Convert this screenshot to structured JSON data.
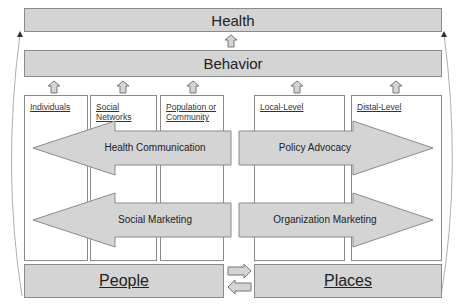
{
  "top": {
    "health": "Health",
    "behavior": "Behavior"
  },
  "columns": [
    {
      "label": "Individuals"
    },
    {
      "label": "Social Networks"
    },
    {
      "label": "Population or Community"
    },
    {
      "label": "Local-Level"
    },
    {
      "label": "Distal-Level"
    }
  ],
  "arrows": {
    "health_communication": "Health Communication",
    "policy_advocacy": "Policy Advocacy",
    "social_marketing": "Social Marketing",
    "organization_marketing": "Organization Marketing"
  },
  "bottom": {
    "people": "People",
    "places": "Places"
  },
  "colors": {
    "fill": "#d4d4d4",
    "stroke": "#8a8a8a"
  }
}
